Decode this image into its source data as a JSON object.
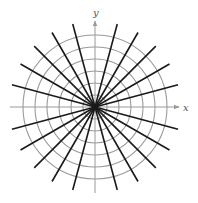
{
  "figure": {
    "type": "polar-grid-with-radial-lines",
    "center": {
      "x": 95,
      "y": 107
    },
    "axes": {
      "x_label": "x",
      "y_label": "y",
      "x_axis": {
        "from": 10,
        "to": 179
      },
      "y_axis": {
        "from": 193,
        "to": 21
      },
      "color": "#9a9a9a"
    },
    "circles": {
      "count": 6,
      "radii": [
        12,
        24,
        36,
        48,
        60,
        72
      ],
      "color": "#9a9a9a"
    },
    "radial_lines": {
      "angles_deg": [
        15,
        30,
        45,
        60,
        75,
        105,
        120,
        135,
        150,
        165
      ],
      "half_length": 86,
      "color": "#1a1a1a"
    }
  }
}
